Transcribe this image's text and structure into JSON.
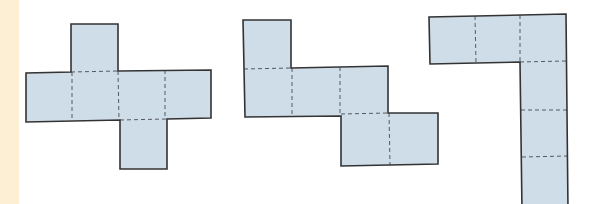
{
  "figure": {
    "description": "Three cube nets made of six square faces each, with dashed fold lines",
    "colors": {
      "face_fill": "#cfdde9",
      "outline": "#333333",
      "fold_line": "#555a60",
      "margin_strip": "#fcefd4",
      "background": "#ffffff"
    },
    "nets": [
      {
        "id": "net-1",
        "label": "Cross-shaped net",
        "faces": 6,
        "layout": "1 top, 4 in middle row, 1 bottom (offset right)"
      },
      {
        "id": "net-2",
        "label": "Staircase net",
        "faces": 6,
        "layout": "1 top-left, 3 in middle row, 2 in bottom row (offset right)"
      },
      {
        "id": "net-3",
        "label": "L-shaped net",
        "faces": 6,
        "layout": "3 in top row, column of faces descending from the rightmost (extends past bottom edge)"
      }
    ]
  }
}
